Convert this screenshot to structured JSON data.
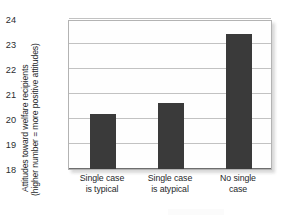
{
  "chart_data": {
    "type": "bar",
    "title": "",
    "xlabel": "",
    "ylabel_line1": "Attitudes toward welfare recipients",
    "ylabel_line2": "(higher number = more positive attitudes)",
    "categories": [
      "Single case is typical",
      "Single case is atypical",
      "No single case"
    ],
    "category_lines": [
      [
        "Single case",
        "is typical"
      ],
      [
        "Single case",
        "is atypical"
      ],
      [
        "No single",
        "case"
      ]
    ],
    "values": [
      20.2,
      20.65,
      23.4
    ],
    "ylim": [
      18,
      24
    ],
    "yticks": [
      18,
      19,
      20,
      21,
      22,
      23,
      24
    ],
    "ytick_labels": [
      "18",
      "19",
      "20",
      "21",
      "22",
      "23",
      "24"
    ],
    "grid": true,
    "legend": false,
    "bar_color": "#3a3a3a",
    "plot_background": "#fefefe",
    "gridline_color": "#c2c2c2",
    "axis_color": "#6e6e6e"
  }
}
